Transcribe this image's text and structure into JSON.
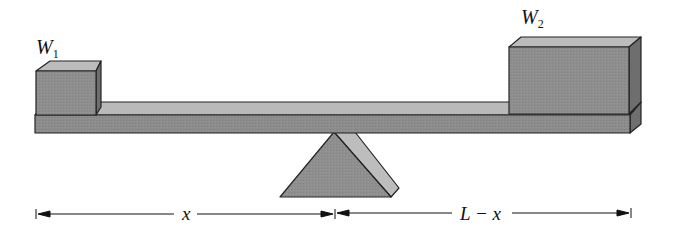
{
  "figure": {
    "weights": [
      {
        "id": "w1",
        "symbol": "W",
        "subscript": "1"
      },
      {
        "id": "w2",
        "symbol": "W",
        "subscript": "2"
      }
    ],
    "dimensions": [
      {
        "id": "left-span",
        "label": "x"
      },
      {
        "id": "right-span",
        "label": "L − x"
      }
    ],
    "colors": {
      "front_face": "#8c8c8c",
      "top_face": "#b9b9b9",
      "side_face": "#7a7a7a",
      "outline": "#222222",
      "dimension_line": "#111111"
    }
  }
}
